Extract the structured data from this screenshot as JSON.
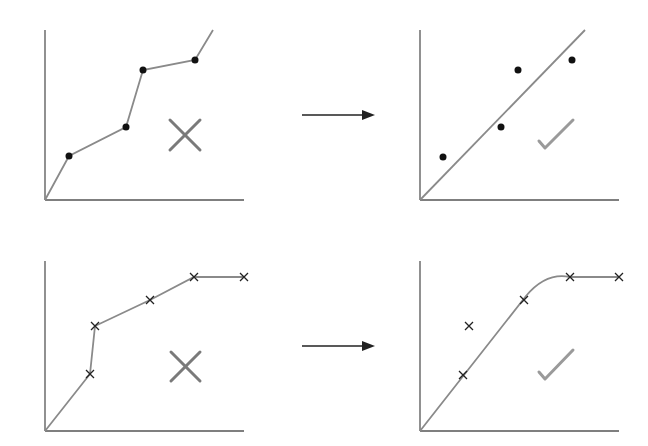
{
  "diagram": {
    "colors": {
      "axis": "#555555",
      "fit_line": "#8a8a8a",
      "point": "#111111",
      "cross_mark": "#7a7a7a",
      "check_mark": "#9a9a9a",
      "arrow": "#222222"
    },
    "rows": [
      {
        "name": "row-1",
        "left_panel": {
          "label": "overfit-polyline",
          "marker": "dot",
          "points": [
            [
              69,
              156
            ],
            [
              126,
              127
            ],
            [
              143,
              70
            ],
            [
              195,
              60
            ]
          ],
          "polyline": [
            [
              45,
              200
            ],
            [
              69,
              156
            ],
            [
              126,
              127
            ],
            [
              143,
              70
            ],
            [
              195,
              60
            ],
            [
              213,
              30
            ]
          ],
          "verdict": "cross"
        },
        "arrow": {
          "from": [
            302,
            115
          ],
          "to": [
            374,
            115
          ]
        },
        "right_panel": {
          "label": "linear-fit",
          "marker": "dot",
          "points": [
            [
              443,
              157
            ],
            [
              501,
              127
            ],
            [
              518,
              70
            ],
            [
              572,
              60
            ]
          ],
          "fit": "straight line",
          "verdict": "check"
        }
      },
      {
        "name": "row-2",
        "left_panel": {
          "label": "overfit-polyline",
          "marker": "x",
          "points": [
            [
              90,
              374
            ],
            [
              95,
              326
            ],
            [
              150,
              300
            ],
            [
              194,
              277
            ],
            [
              244,
              277
            ]
          ],
          "polyline": [
            [
              45,
              431
            ],
            [
              90,
              374
            ],
            [
              95,
              326
            ],
            [
              150,
              300
            ],
            [
              194,
              277
            ],
            [
              244,
              277
            ]
          ],
          "verdict": "cross"
        },
        "arrow": {
          "from": [
            302,
            346
          ],
          "to": [
            374,
            346
          ]
        },
        "right_panel": {
          "label": "smooth-saturating-fit",
          "marker": "x",
          "points": [
            [
              463,
              375
            ],
            [
              469,
              326
            ],
            [
              524,
              300
            ],
            [
              570,
              277
            ],
            [
              619,
              277
            ]
          ],
          "fit": "linear rise then smooth plateau",
          "verdict": "check"
        }
      }
    ]
  }
}
